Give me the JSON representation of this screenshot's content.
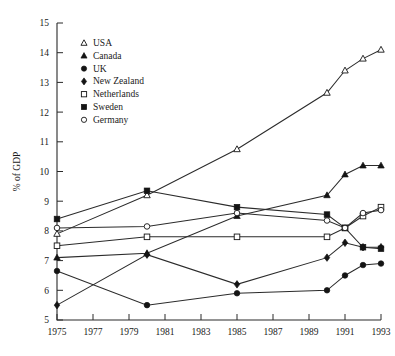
{
  "chart_data": {
    "type": "line",
    "title": "",
    "xlabel": "",
    "ylabel": "% of GDP",
    "xlim": [
      1975,
      1993
    ],
    "ylim": [
      5,
      15
    ],
    "xticks": [
      1975,
      1977,
      1979,
      1981,
      1983,
      1985,
      1987,
      1989,
      1991,
      1993
    ],
    "yticks": [
      5,
      6,
      7,
      8,
      9,
      10,
      11,
      12,
      13,
      14,
      15
    ],
    "grid": false,
    "legend_position": "upper-left-inside",
    "series": [
      {
        "name": "USA",
        "marker": "open-triangle",
        "x": [
          1975,
          1980,
          1985,
          1990,
          1991,
          1992,
          1993
        ],
        "values": [
          7.9,
          9.2,
          10.75,
          12.65,
          13.4,
          13.8,
          14.1
        ]
      },
      {
        "name": "Canada",
        "marker": "filled-triangle",
        "x": [
          1975,
          1980,
          1985,
          1990,
          1991,
          1992,
          1993
        ],
        "values": [
          7.1,
          7.25,
          8.5,
          9.2,
          9.9,
          10.2,
          10.2
        ]
      },
      {
        "name": "UK",
        "marker": "filled-circle",
        "x": [
          1975,
          1980,
          1985,
          1990,
          1991,
          1992,
          1993
        ],
        "values": [
          6.65,
          5.5,
          5.9,
          6.0,
          6.5,
          6.85,
          6.9
        ]
      },
      {
        "name": "New Zealand",
        "marker": "filled-diamond",
        "x": [
          1975,
          1980,
          1985,
          1990,
          1991,
          1992,
          1993
        ],
        "values": [
          5.5,
          7.2,
          6.2,
          7.1,
          7.6,
          7.45,
          7.45
        ]
      },
      {
        "name": "Netherlands",
        "marker": "open-square",
        "x": [
          1975,
          1980,
          1985,
          1990,
          1991,
          1992,
          1993
        ],
        "values": [
          7.5,
          7.8,
          7.8,
          7.8,
          8.1,
          8.5,
          8.8
        ]
      },
      {
        "name": "Sweden",
        "marker": "filled-square",
        "x": [
          1975,
          1980,
          1985,
          1990,
          1991,
          1992,
          1993
        ],
        "values": [
          8.4,
          9.35,
          8.8,
          8.55,
          8.1,
          7.45,
          7.4
        ]
      },
      {
        "name": "Germany",
        "marker": "open-circle",
        "x": [
          1975,
          1980,
          1985,
          1990,
          1991,
          1992,
          1993
        ],
        "values": [
          8.1,
          8.15,
          8.6,
          8.35,
          8.1,
          8.6,
          8.7
        ]
      }
    ]
  },
  "legend": {
    "items": [
      {
        "label": "USA",
        "marker": "open-triangle"
      },
      {
        "label": "Canada",
        "marker": "filled-triangle"
      },
      {
        "label": "UK",
        "marker": "filled-circle"
      },
      {
        "label": "New Zealand",
        "marker": "filled-diamond"
      },
      {
        "label": "Netherlands",
        "marker": "open-square"
      },
      {
        "label": "Sweden",
        "marker": "filled-square"
      },
      {
        "label": "Germany",
        "marker": "open-circle"
      }
    ]
  },
  "colors": {
    "ink": "#1a1a1a",
    "line": "#2b2b2b",
    "background": "#ffffff"
  }
}
